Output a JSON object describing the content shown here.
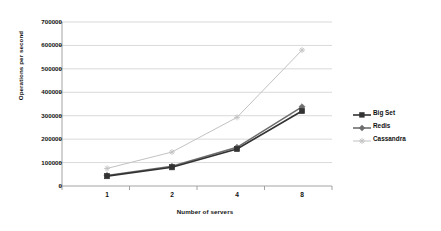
{
  "chart_data": {
    "type": "line",
    "title": "",
    "xlabel": "Number of servers",
    "ylabel": "Operations per second",
    "categories": [
      "1",
      "2",
      "4",
      "8"
    ],
    "ylim": [
      0,
      700000
    ],
    "ytick_values": [
      0,
      100000,
      200000,
      300000,
      400000,
      500000,
      600000,
      700000
    ],
    "ytick_labels": [
      "0",
      "100000",
      "200000",
      "300000",
      "400000",
      "500000",
      "600000",
      "700000"
    ],
    "grid": true,
    "legend_position": "right",
    "series": [
      {
        "name": "Big Set",
        "values": [
          42000,
          80000,
          158000,
          320000
        ],
        "color": "#333333",
        "marker": "square"
      },
      {
        "name": "Redis",
        "values": [
          45000,
          84000,
          165000,
          338000
        ],
        "color": "#6e6e6e",
        "marker": "diamond"
      },
      {
        "name": "Cassandra",
        "values": [
          75000,
          145000,
          293000,
          580000
        ],
        "color": "#c2c2c2",
        "marker": "asterisk"
      }
    ]
  },
  "plot": {
    "left": 62,
    "right": 332,
    "top": 22,
    "bottom": 186,
    "category_x": [
      107,
      172,
      237,
      302
    ],
    "axis_color": "#9a9a9a",
    "grid_color": "#c9c9c9",
    "background": "#ffffff"
  }
}
